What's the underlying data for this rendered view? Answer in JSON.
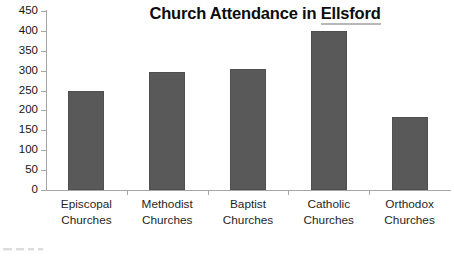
{
  "chart_data": {
    "type": "bar",
    "title": "Church Attendance in Ellsford",
    "title_parts": {
      "lead": "Church Attendance in ",
      "flagged_word": "Ellsford"
    },
    "categories": [
      "Episcopal Churches",
      "Methodist Churches",
      "Baptist Churches",
      "Catholic Churches",
      "Orthodox Churches"
    ],
    "category_lines": [
      [
        "Episcopal",
        "Churches"
      ],
      [
        "Methodist",
        "Churches"
      ],
      [
        "Baptist",
        "Churches"
      ],
      [
        "Catholic",
        "Churches"
      ],
      [
        "Orthodox",
        "Churches"
      ]
    ],
    "values": [
      250,
      297,
      305,
      400,
      184
    ],
    "xlabel": "",
    "ylabel": "",
    "ylim": [
      0,
      450
    ],
    "ytick_values": [
      0,
      50,
      100,
      150,
      200,
      250,
      300,
      350,
      400,
      450
    ],
    "ytick_labels": [
      "0",
      "50",
      "100",
      "150",
      "200",
      "250",
      "300",
      "350",
      "400",
      "450"
    ],
    "grid": false,
    "legend": false,
    "legend_position": "none",
    "bar_color": "#595959",
    "axis_color": "#a6a6a6",
    "title_color": "#0d0d0d",
    "background_color": "#ffffff"
  }
}
